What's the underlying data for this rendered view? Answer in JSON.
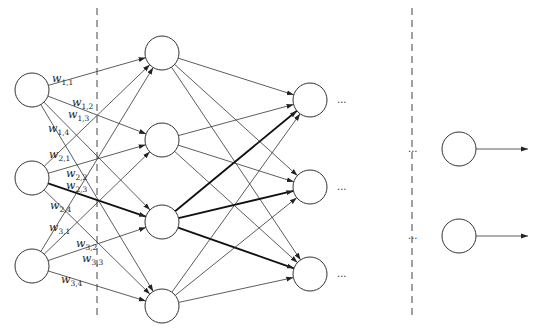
{
  "diagram": {
    "type": "feed-forward neural network",
    "colors": {
      "stroke": "#333333",
      "background": "#ffffff",
      "thick_edge": "#111111"
    },
    "node_radius": 17,
    "layers": [
      {
        "name": "input",
        "x": 32,
        "nodes_y": [
          90,
          178,
          266
        ]
      },
      {
        "name": "hidden1",
        "x": 162,
        "nodes_y": [
          53,
          140,
          222,
          306
        ]
      },
      {
        "name": "hidden2",
        "x": 310,
        "nodes_y": [
          100,
          187,
          274
        ]
      },
      {
        "name": "output",
        "x": 459,
        "nodes_y": [
          149,
          236
        ]
      }
    ],
    "dividers": [
      {
        "x": 97,
        "y1": 8,
        "y2": 316
      },
      {
        "x": 412,
        "y1": 8,
        "y2": 316
      }
    ],
    "thick_edges": [
      {
        "from": "input.1",
        "to": "hidden1.2"
      },
      {
        "from": "hidden1.2",
        "to": "hidden2.0"
      },
      {
        "from": "hidden1.2",
        "to": "hidden2.1"
      },
      {
        "from": "hidden1.2",
        "to": "hidden2.2"
      }
    ],
    "weight_labels": [
      {
        "base": "w",
        "sub": "1,1",
        "x": 52,
        "y": 82
      },
      {
        "base": "w",
        "sub": "1,2",
        "x": 72,
        "y": 106
      },
      {
        "base": "w",
        "sub": "1,3",
        "x": 68,
        "y": 118
      },
      {
        "base": "w",
        "sub": "1,4",
        "x": 48,
        "y": 132
      },
      {
        "base": "w",
        "sub": "2,1",
        "x": 49,
        "y": 158
      },
      {
        "base": "w",
        "sub": "2,2",
        "x": 66,
        "y": 177
      },
      {
        "base": "w",
        "sub": "2,3",
        "x": 66,
        "y": 189
      },
      {
        "base": "w",
        "sub": "2,4",
        "x": 50,
        "y": 209
      },
      {
        "base": "w",
        "sub": "3,1",
        "x": 49,
        "y": 231
      },
      {
        "base": "w",
        "sub": "3,2",
        "x": 76,
        "y": 247
      },
      {
        "base": "w",
        "sub": "3,3",
        "x": 82,
        "y": 262
      },
      {
        "base": "w",
        "sub": "3,4",
        "x": 61,
        "y": 283
      }
    ],
    "ellipses": [
      {
        "text": "...",
        "x": 337,
        "y": 103
      },
      {
        "text": "...",
        "x": 337,
        "y": 190
      },
      {
        "text": "...",
        "x": 337,
        "y": 277
      },
      {
        "text": "...",
        "x": 408,
        "y": 152
      },
      {
        "text": "...",
        "x": 408,
        "y": 239
      }
    ],
    "output_arrows": [
      {
        "x1": 476,
        "y": 149,
        "x2": 528
      },
      {
        "x1": 476,
        "y": 236,
        "x2": 528
      }
    ]
  }
}
